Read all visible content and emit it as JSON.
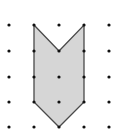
{
  "diagram": {
    "type": "dot-grid-polygon",
    "grid": {
      "columns_x": [
        9,
        34,
        59,
        84,
        109
      ],
      "rows_y": [
        25,
        51,
        77,
        102,
        127
      ],
      "dot_radius": 1.6,
      "dot_color": "#111111"
    },
    "polygon": {
      "name": "chevron-arrow-shape",
      "grid_points": [
        [
          1,
          0
        ],
        [
          2,
          1
        ],
        [
          3,
          0
        ],
        [
          3,
          3
        ],
        [
          2,
          4
        ],
        [
          1,
          3
        ]
      ],
      "fill": "#d6d6d6",
      "stroke": "#4a4a4a",
      "stroke_width": 1.3
    },
    "background": "#ffffff"
  }
}
